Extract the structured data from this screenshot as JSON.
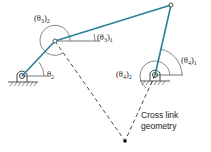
{
  "diagram": {
    "labels": {
      "theta3_2": "(θ",
      "theta3_2_sub": "3",
      "theta3_2_close": ")",
      "theta3_2_idx": "2",
      "theta3_1": "(θ",
      "theta3_1_sub": "3",
      "theta3_1_close": ")",
      "theta3_1_idx": "1",
      "theta2": "θ",
      "theta2_sub": "2",
      "theta4_2": "(θ",
      "theta4_2_sub": "4",
      "theta4_2_close": ")",
      "theta4_2_idx": "2",
      "theta4_1": "(θ",
      "theta4_1_sub": "4",
      "theta4_1_close": ")",
      "theta4_1_idx": "1"
    },
    "caption_line1": "Cross link",
    "caption_line2": "geometry",
    "colors": {
      "link": "#2a7f9a",
      "dashed": "#333333",
      "arc": "#555555"
    }
  }
}
